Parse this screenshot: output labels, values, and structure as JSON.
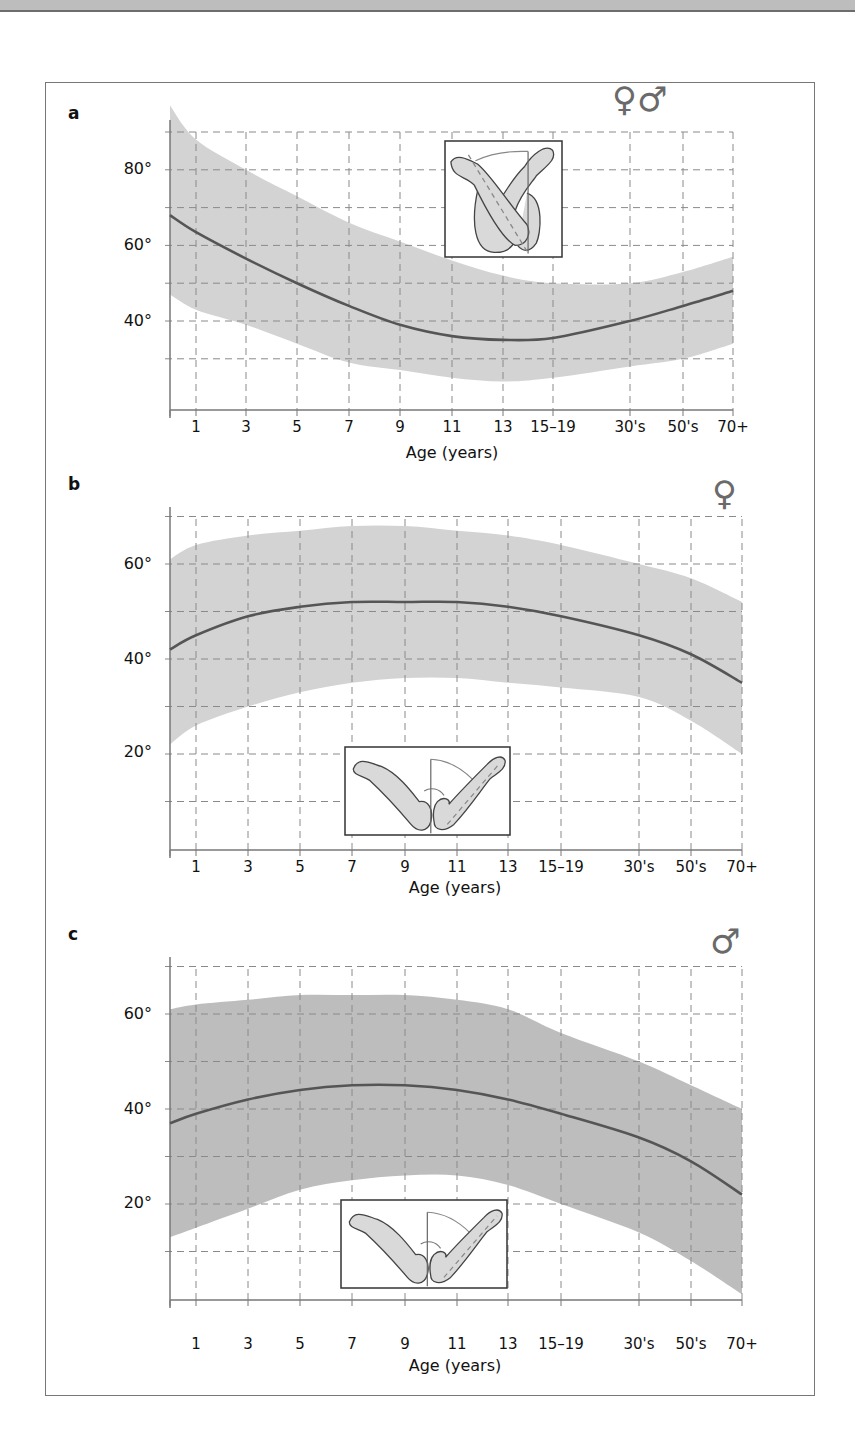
{
  "page": {
    "xlabel": "Age (years)"
  },
  "chart_data": [
    {
      "panel": "a",
      "type": "area",
      "title": "a",
      "sex_symbol": "♀♂",
      "sex": "female and male",
      "categories": [
        "0",
        "1",
        "3",
        "5",
        "7",
        "9",
        "11",
        "13",
        "15–19",
        "30's",
        "50's",
        "70+"
      ],
      "xtick_labels": [
        "1",
        "3",
        "5",
        "7",
        "9",
        "11",
        "13",
        "15–19",
        "30's",
        "50's",
        "70+"
      ],
      "xlabel": "Age (years)",
      "ylabel": "",
      "ylim": [
        0,
        90
      ],
      "yticks_labeled": [
        "80°",
        "60°",
        "40°"
      ],
      "grid": true,
      "band_color": "#d3d3d3",
      "series": [
        {
          "name": "mean",
          "values": [
            68,
            63.5,
            56.5,
            50,
            44,
            39,
            36,
            35,
            35.5,
            40,
            44,
            48
          ]
        },
        {
          "name": "upper",
          "values": [
            97,
            88,
            80,
            73,
            66,
            61,
            56,
            52,
            50,
            50,
            53,
            57
          ]
        },
        {
          "name": "lower",
          "values": [
            47,
            43,
            39,
            34,
            29,
            27,
            25,
            24,
            25,
            28,
            30,
            34
          ]
        }
      ],
      "inset": "arms crossed (horizontal adduction)"
    },
    {
      "panel": "b",
      "type": "area",
      "title": "b",
      "sex_symbol": "♀",
      "sex": "female",
      "categories": [
        "0",
        "1",
        "3",
        "5",
        "7",
        "9",
        "11",
        "13",
        "15–19",
        "30's",
        "50's",
        "70+"
      ],
      "xtick_labels": [
        "1",
        "3",
        "5",
        "7",
        "9",
        "11",
        "13",
        "15–19",
        "30's",
        "50's",
        "70+"
      ],
      "xlabel": "Age (years)",
      "ylabel": "",
      "ylim": [
        0,
        70
      ],
      "yticks_labeled": [
        "60°",
        "40°",
        "20°"
      ],
      "grid": true,
      "band_color": "#d3d3d3",
      "series": [
        {
          "name": "mean",
          "values": [
            42,
            45,
            49,
            51,
            52,
            52,
            52,
            51,
            49,
            45,
            41,
            35
          ]
        },
        {
          "name": "upper",
          "values": [
            61,
            64,
            66,
            67,
            68,
            68,
            67,
            66,
            64,
            60,
            57,
            52
          ]
        },
        {
          "name": "lower",
          "values": [
            22,
            26,
            30,
            33,
            35,
            36,
            36,
            35,
            34,
            32,
            27,
            20
          ]
        }
      ],
      "inset": "elbow extension / carrying angle"
    },
    {
      "panel": "c",
      "type": "area",
      "title": "c",
      "sex_symbol": "♂",
      "sex": "male",
      "categories": [
        "0",
        "1",
        "3",
        "5",
        "7",
        "9",
        "11",
        "13",
        "15–19",
        "30's",
        "50's",
        "70+"
      ],
      "xtick_labels": [
        "1",
        "3",
        "5",
        "7",
        "9",
        "11",
        "13",
        "15–19",
        "30's",
        "50's",
        "70+"
      ],
      "xlabel": "Age (years)",
      "ylabel": "",
      "ylim": [
        0,
        70
      ],
      "yticks_labeled": [
        "60°",
        "40°",
        "20°"
      ],
      "grid": true,
      "band_color": "#bdbdbd",
      "series": [
        {
          "name": "mean",
          "values": [
            37,
            39,
            42,
            44,
            45,
            45,
            44,
            42,
            39,
            34,
            29,
            22
          ]
        },
        {
          "name": "upper",
          "values": [
            61,
            62,
            63,
            64,
            64,
            64,
            63,
            61,
            56,
            50,
            45,
            40
          ]
        },
        {
          "name": "lower",
          "values": [
            13,
            15,
            19,
            23,
            25,
            26,
            26,
            24,
            20,
            14,
            8,
            1
          ]
        }
      ],
      "inset": "elbow extension / carrying angle"
    }
  ]
}
